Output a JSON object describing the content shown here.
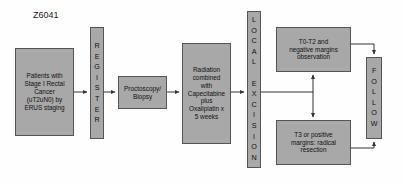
{
  "diagram": {
    "title": "Z6041",
    "type": "clinical-trial-schema-flowchart",
    "colors": {
      "node_fill": "#a8a8a8",
      "node_border": "#555555",
      "connector": "#333333",
      "background": "#fefefe",
      "text": "#111111"
    },
    "nodes": [
      {
        "id": "eligibility",
        "name": "patients-box",
        "shape": "rect",
        "text": "Patients with\nStage I Rectal\nCancer\n(uT2uN0) by\nERUS staging",
        "x": 15,
        "y": 48,
        "w": 59,
        "h": 88,
        "font_size": 6.4
      },
      {
        "id": "register",
        "name": "register-bar",
        "shape": "vertical-bar",
        "text": "REGISTER",
        "x": 90,
        "y": 27,
        "w": 14,
        "h": 112,
        "font_size": 7.2
      },
      {
        "id": "proctoscopy",
        "name": "proctoscopy-biopsy-box",
        "shape": "rect",
        "text": "Proctoscopy/\nBiopsy",
        "x": 118,
        "y": 76,
        "w": 49,
        "h": 33,
        "font_size": 6.4
      },
      {
        "id": "chemoradiation",
        "name": "radiation-chemo-box",
        "shape": "rect",
        "text": "Radiation\ncombined\nwith\nCapecitabine\nplus\nOxaliplatin x\n5 weeks",
        "x": 182,
        "y": 43,
        "w": 49,
        "h": 101,
        "font_size": 6.4
      },
      {
        "id": "local_excision",
        "name": "local-excision-bar",
        "shape": "vertical-bar",
        "text": "LOCAL EXCISION",
        "x": 247,
        "y": 11,
        "w": 14,
        "h": 157,
        "font_size": 7.2
      },
      {
        "id": "observation",
        "name": "t0-t2-negative-margins-box",
        "shape": "rect",
        "text": "T0-T2 and\nnegative margins\nobservation",
        "x": 276,
        "y": 27,
        "w": 75,
        "h": 45,
        "font_size": 6.4
      },
      {
        "id": "radical_resection",
        "name": "t3-positive-margins-box",
        "shape": "rect",
        "text": "T3 or positive\nmargins: radical\nresection",
        "x": 276,
        "y": 120,
        "w": 75,
        "h": 45,
        "font_size": 6.4
      },
      {
        "id": "follow",
        "name": "follow-bar",
        "shape": "vertical-bar",
        "text": "FOLLOW",
        "x": 366,
        "y": 57,
        "w": 16,
        "h": 82,
        "font_size": 7.2
      }
    ],
    "connectors": [
      {
        "name": "connector-patients-to-register",
        "from": "eligibility",
        "to": "register",
        "path": "M74,92 L87,92",
        "arrow": "end"
      },
      {
        "name": "connector-register-to-proctoscopy",
        "from": "register",
        "to": "proctoscopy",
        "path": "M104,92 L115,92",
        "arrow": "end"
      },
      {
        "name": "connector-proctoscopy-to-chemoradiation",
        "from": "proctoscopy",
        "to": "chemoradiation",
        "path": "M167,92 L179,92",
        "arrow": "end"
      },
      {
        "name": "connector-chemoradiation-to-local-excision",
        "from": "chemoradiation",
        "to": "local_excision",
        "path": "M231,92 L244,92",
        "arrow": "end"
      },
      {
        "name": "connector-local-excision-branch",
        "from": "local_excision",
        "to": "branch-point",
        "path": "M261,92 L313,92",
        "arrow": "none"
      },
      {
        "name": "connector-branch-to-observation",
        "from": "branch-point",
        "to": "observation",
        "path": "M313,92 L313,75",
        "arrow": "end"
      },
      {
        "name": "connector-branch-to-radical-resection",
        "from": "branch-point",
        "to": "radical_resection",
        "path": "M313,92 L313,117",
        "arrow": "end"
      },
      {
        "name": "connector-observation-to-follow",
        "from": "observation",
        "to": "follow",
        "path": "M351,44 L374,44 L374,54",
        "arrow": "end"
      },
      {
        "name": "connector-radical-resection-to-follow",
        "from": "radical_resection",
        "to": "follow",
        "path": "M351,148 L374,148 L374,142",
        "arrow": "end"
      }
    ]
  }
}
